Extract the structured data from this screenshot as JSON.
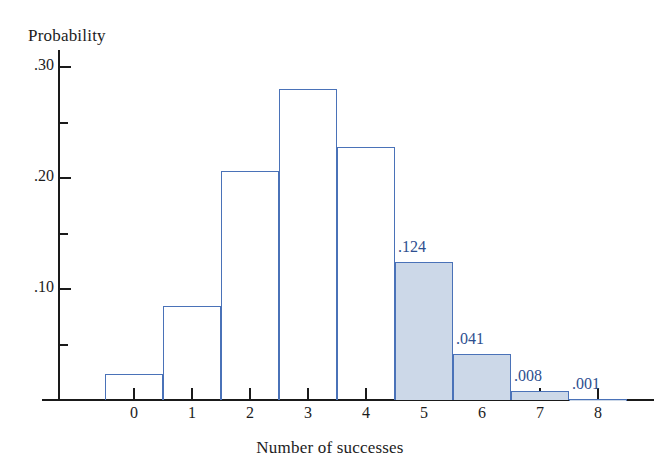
{
  "chart_data": {
    "type": "bar",
    "title": "",
    "subtitle": "",
    "xlabel": "Number of successes",
    "ylabel": "Probability",
    "categories": [
      "0",
      "1",
      "2",
      "3",
      "4",
      "5",
      "6",
      "7",
      "8"
    ],
    "values": [
      0.023,
      0.085,
      0.206,
      0.28,
      0.228,
      0.124,
      0.041,
      0.008,
      0.001
    ],
    "point_labels": [
      "",
      "",
      "",
      "",
      "",
      ".124",
      ".041",
      ".008",
      ".001"
    ],
    "highlighted_categories": [
      "5",
      "6",
      "7",
      "8"
    ],
    "ylim": [
      0,
      0.315
    ],
    "xlim": [
      -0.5,
      8.5
    ],
    "y_major_ticks": [
      0.1,
      0.2,
      0.3
    ],
    "y_major_tick_labels": [
      ".10",
      ".20",
      ".30"
    ],
    "y_minor_ticks": [
      0.05,
      0.15,
      0.25
    ],
    "x_ticks": [
      0,
      1,
      2,
      3,
      4,
      5,
      6,
      7,
      8
    ],
    "grid": false,
    "legend": "none",
    "colors": {
      "bar_outline": "#4a72b8",
      "bar_fill_highlight": "#ccd8e8",
      "bar_fill_default": "#ffffff",
      "axis": "#1a1a1a",
      "label_text": "#2d4f8f",
      "axis_text": "#1c1c1c",
      "background": "#ffffff"
    }
  }
}
